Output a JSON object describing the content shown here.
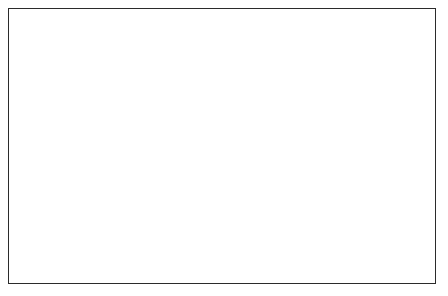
{
  "chart_data": {
    "type": "area",
    "title": "",
    "subtitle": "",
    "xlabel": "",
    "ylabel": "Percentage of total population",
    "y2label": "Age",
    "xlim": [
      1921,
      1983
    ],
    "ylim": [
      0,
      100
    ],
    "grid": false,
    "legend_position": "right-axis-labels",
    "x": [
      1921,
      1931,
      1941,
      1951,
      1956,
      1961,
      1966,
      1971,
      1976,
      1983
    ],
    "x_ticklabels": [
      "1921",
      "1941",
      "1961",
      "1983"
    ],
    "x_ticklabel_values": [
      1921,
      1941,
      1961,
      1983
    ],
    "x_minor_tick_values": [
      1926,
      1931,
      1936,
      1946,
      1951,
      1956,
      1966,
      1971,
      1976,
      1981
    ],
    "y_ticklabels": [
      "0",
      "50",
      "100"
    ],
    "y_ticklabel_values": [
      0,
      50,
      100
    ],
    "y_minor_tick_values": [
      10,
      20,
      30,
      40,
      60,
      70,
      80,
      90
    ],
    "series": [
      {
        "name": "0-4 (young)",
        "boundary_label": "4",
        "hatched": true,
        "cumulative_top_values": [
          10.2,
          9.6,
          8.6,
          9.2,
          9.3,
          9.2,
          9.1,
          8.8,
          8.3,
          7.8
        ]
      },
      {
        "name": "5-14",
        "boundary_label": "14",
        "hatched": true,
        "cumulative_top_values": [
          31.9,
          29.5,
          26.2,
          25.6,
          26.6,
          27.1,
          26.0,
          25.0,
          23.6,
          21.8
        ]
      },
      {
        "name": "15-24",
        "boundary_label": "24",
        "hatched": false,
        "cumulative_top_values": [
          48.3,
          45.0,
          40.4,
          40.2,
          40.4,
          40.7,
          38.0,
          36.6,
          35.6,
          34.4
        ]
      },
      {
        "name": "25-44",
        "boundary_label": "44",
        "hatched": false,
        "cumulative_top_values": [
          76.5,
          75.2,
          72.0,
          69.8,
          68.0,
          66.9,
          66.6,
          66.4,
          66.3,
          66.2
        ]
      },
      {
        "name": "45-64",
        "boundary_label": "64",
        "hatched": false,
        "cumulative_top_values": [
          93.9,
          93.3,
          92.6,
          92.1,
          91.6,
          91.2,
          90.9,
          90.6,
          90.4,
          90.1
        ]
      },
      {
        "name": "65+ (old)",
        "boundary_label": "old",
        "hatched": true,
        "cumulative_top_values": [
          100,
          100,
          100,
          100,
          100,
          100,
          100,
          100,
          100,
          100
        ]
      }
    ],
    "right_axis_labels": [
      {
        "text": "old",
        "value": 96.5,
        "tick": false
      },
      {
        "text": "64",
        "value": 90.1,
        "tick": true
      },
      {
        "text": "44",
        "value": 66.2,
        "tick": true
      },
      {
        "text": "24",
        "value": 34.4,
        "tick": true
      },
      {
        "text": "14",
        "value": 21.8,
        "tick": true
      },
      {
        "text": "young",
        "value": 14.5,
        "tick": false
      },
      {
        "text": "4",
        "value": 7.8,
        "tick": true
      }
    ]
  }
}
